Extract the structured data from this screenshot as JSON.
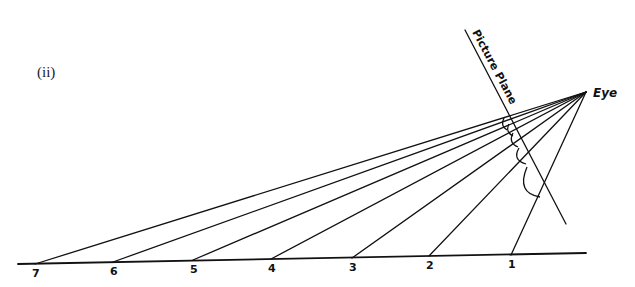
{
  "figure": {
    "label": "(ii)",
    "eye_label": "Eye",
    "plane_label": "Picture Plane",
    "colors": {
      "ink": "#111111",
      "background": "#ffffff"
    },
    "eye_point": [
      586,
      92
    ],
    "picture_plane": {
      "from": [
        465,
        30
      ],
      "to": [
        566,
        224
      ]
    },
    "ground_line": {
      "from": [
        18,
        264
      ],
      "to": [
        586,
        253
      ]
    },
    "ground_points": [
      {
        "label": "7",
        "x": 35,
        "y": 264
      },
      {
        "label": "6",
        "x": 113,
        "y": 262
      },
      {
        "label": "5",
        "x": 193,
        "y": 260
      },
      {
        "label": "4",
        "x": 271,
        "y": 259
      },
      {
        "label": "3",
        "x": 352,
        "y": 258
      },
      {
        "label": "2",
        "x": 429,
        "y": 256
      },
      {
        "label": "1",
        "x": 511,
        "y": 255
      }
    ]
  }
}
